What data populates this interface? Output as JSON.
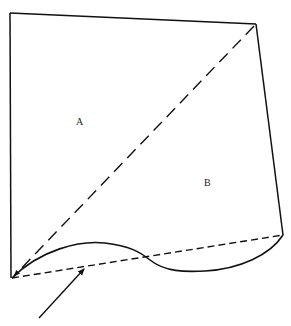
{
  "diagram": {
    "labels": {
      "region_a": "A",
      "region_b": "B"
    },
    "colors": {
      "stroke": "#111111",
      "background": "#ffffff"
    }
  }
}
